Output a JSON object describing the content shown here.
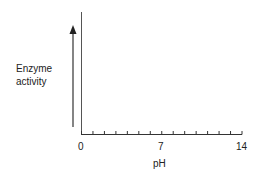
{
  "chart_data": {
    "type": "line",
    "title": "",
    "xlabel": "pH",
    "ylabel": "Enzyme activity",
    "ylabel_lines": [
      "Enzyme",
      "activity"
    ],
    "xlim": [
      0,
      14
    ],
    "xticks_major_labels": [
      "0",
      "7",
      "14"
    ],
    "xticks_major_values": [
      0,
      7,
      14
    ],
    "xticks_minor_step": 1,
    "ylim": null,
    "yticks": [],
    "grid": false,
    "legend": null,
    "series": [],
    "annotations": [
      {
        "type": "arrow",
        "direction": "up",
        "meaning": "increasing enzyme activity"
      }
    ],
    "note": "Empty axes template; no data plotted"
  },
  "colors": {
    "axis": "#333333",
    "text": "#222222",
    "background": "#ffffff"
  }
}
